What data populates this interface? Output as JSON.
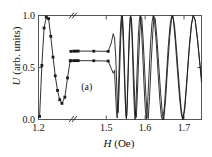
{
  "figure": {
    "panel_label": "(a)",
    "background": "#ffffff",
    "line_color": "#1a1a1a",
    "axis_color": "#555555"
  },
  "axes": {
    "x": {
      "label_var": "H",
      "label_unit": "(Oe)",
      "ticks": [
        "1.2",
        "1.5",
        "1.6",
        "1.7"
      ],
      "tick_values": [
        1.2,
        1.5,
        1.6,
        1.7
      ],
      "broken": true,
      "break_marker": "//",
      "range": [
        1.2,
        1.745
      ]
    },
    "y": {
      "label_var": "U",
      "label_unit": "(arb. units)",
      "ticks": [
        "0.0",
        "0.5",
        "1.0"
      ],
      "tick_values": [
        0.0,
        0.5,
        1.0
      ],
      "range": [
        0.0,
        1.0
      ]
    }
  },
  "chart_data": {
    "type": "line",
    "title": "",
    "xlabel": "H (Oe)",
    "ylabel": "U (arb. units)",
    "xlim": [
      1.2,
      1.745
    ],
    "ylim": [
      0.0,
      1.0
    ],
    "grid": false,
    "legend": null,
    "axis_break": {
      "after": 1.215,
      "resumes": 1.43,
      "marker": "//"
    },
    "annotations": [
      {
        "text": "(a)",
        "x": 1.45,
        "y": 0.28
      }
    ],
    "series": [
      {
        "name": "spike-branch",
        "marker": "square",
        "points": [
          [
            1.2005,
            0.03
          ],
          [
            1.2015,
            0.52
          ],
          [
            1.2025,
            0.88
          ],
          [
            1.2035,
            0.985
          ],
          [
            1.2045,
            0.97
          ],
          [
            1.2055,
            0.8
          ],
          [
            1.2065,
            0.6
          ],
          [
            1.2075,
            0.42
          ],
          [
            1.2085,
            0.28
          ],
          [
            1.2095,
            0.19
          ],
          [
            1.2105,
            0.155
          ],
          [
            1.2118,
            0.215
          ],
          [
            1.213,
            0.4
          ],
          [
            1.2142,
            0.565
          ]
        ]
      },
      {
        "name": "upper-plateau",
        "marker": "square",
        "marker_x": [
          1.2145,
          1.268,
          1.335,
          1.405,
          1.468,
          1.505
        ],
        "points": [
          [
            1.2145,
            0.655
          ],
          [
            1.268,
            0.657
          ],
          [
            1.335,
            0.657
          ],
          [
            1.405,
            0.658
          ],
          [
            1.468,
            0.657
          ],
          [
            1.505,
            0.655
          ],
          [
            1.513,
            0.735
          ],
          [
            1.518,
            0.825
          ],
          [
            1.5215,
            0.78
          ]
        ]
      },
      {
        "name": "lower-plateau",
        "marker": "square",
        "marker_x": [
          1.2145,
          1.268,
          1.335,
          1.405,
          1.468,
          1.505
        ],
        "points": [
          [
            1.2145,
            0.565
          ],
          [
            1.268,
            0.566
          ],
          [
            1.335,
            0.566
          ],
          [
            1.405,
            0.566
          ],
          [
            1.468,
            0.565
          ],
          [
            1.505,
            0.562
          ],
          [
            1.512,
            0.5
          ],
          [
            1.518,
            0.445
          ],
          [
            1.5215,
            0.47
          ]
        ]
      },
      {
        "name": "chirped-oscillation",
        "marker": "none",
        "comment": "interference fringes, period grows with H",
        "points": [
          [
            1.5215,
            0.78
          ],
          [
            1.5245,
            0.6
          ],
          [
            1.527,
            0.33
          ],
          [
            1.529,
            0.12
          ],
          [
            1.5305,
            0.065
          ],
          [
            1.5325,
            0.22
          ],
          [
            1.535,
            0.52
          ],
          [
            1.5375,
            0.8
          ],
          [
            1.54,
            0.97
          ],
          [
            1.5415,
            0.995
          ],
          [
            1.5435,
            0.9
          ],
          [
            1.546,
            0.62
          ],
          [
            1.5485,
            0.3
          ],
          [
            1.5505,
            0.06
          ],
          [
            1.552,
            0.005
          ],
          [
            1.554,
            0.17
          ],
          [
            1.5565,
            0.5
          ],
          [
            1.559,
            0.82
          ],
          [
            1.5615,
            0.98
          ],
          [
            1.563,
            1.0
          ],
          [
            1.565,
            0.93
          ],
          [
            1.5675,
            0.66
          ],
          [
            1.57,
            0.33
          ],
          [
            1.5725,
            0.08
          ],
          [
            1.5742,
            0.0
          ],
          [
            1.5765,
            0.14
          ],
          [
            1.5795,
            0.48
          ],
          [
            1.5825,
            0.8
          ],
          [
            1.5855,
            0.97
          ],
          [
            1.5875,
            1.0
          ],
          [
            1.59,
            0.92
          ],
          [
            1.5935,
            0.66
          ],
          [
            1.597,
            0.35
          ],
          [
            1.6005,
            0.1
          ],
          [
            1.603,
            0.005
          ],
          [
            1.606,
            0.12
          ],
          [
            1.61,
            0.43
          ],
          [
            1.614,
            0.74
          ],
          [
            1.618,
            0.94
          ],
          [
            1.621,
            1.0
          ],
          [
            1.6245,
            0.94
          ],
          [
            1.629,
            0.72
          ],
          [
            1.6335,
            0.44
          ],
          [
            1.638,
            0.18
          ],
          [
            1.642,
            0.02
          ],
          [
            1.645,
            0.0
          ],
          [
            1.6495,
            0.12
          ],
          [
            1.6545,
            0.4
          ],
          [
            1.6595,
            0.7
          ],
          [
            1.6645,
            0.92
          ],
          [
            1.6685,
            1.0
          ],
          [
            1.6725,
            0.96
          ],
          [
            1.6775,
            0.76
          ],
          [
            1.683,
            0.48
          ],
          [
            1.6885,
            0.21
          ],
          [
            1.6935,
            0.04
          ],
          [
            1.697,
            0.0
          ],
          [
            1.702,
            0.13
          ],
          [
            1.708,
            0.42
          ],
          [
            1.714,
            0.72
          ],
          [
            1.7195,
            0.93
          ],
          [
            1.724,
            1.0
          ],
          [
            1.729,
            0.95
          ],
          [
            1.735,
            0.76
          ],
          [
            1.741,
            0.52
          ],
          [
            1.745,
            0.36
          ]
        ]
      },
      {
        "name": "chirped-oscillation-second",
        "marker": "none",
        "comment": "second interleaved fringe branch (phase-shifted)",
        "points": [
          [
            1.5215,
            0.47
          ],
          [
            1.524,
            0.26
          ],
          [
            1.5262,
            0.09
          ],
          [
            1.528,
            0.015
          ],
          [
            1.53,
            0.13
          ],
          [
            1.5325,
            0.42
          ],
          [
            1.535,
            0.72
          ],
          [
            1.5375,
            0.93
          ],
          [
            1.5392,
            1.0
          ],
          [
            1.5412,
            0.96
          ],
          [
            1.5438,
            0.74
          ],
          [
            1.5465,
            0.44
          ],
          [
            1.549,
            0.17
          ],
          [
            1.5512,
            0.02
          ],
          [
            1.553,
            0.04
          ],
          [
            1.5552,
            0.28
          ],
          [
            1.5578,
            0.6
          ],
          [
            1.5605,
            0.87
          ],
          [
            1.5625,
            0.99
          ],
          [
            1.5645,
            0.98
          ],
          [
            1.5672,
            0.8
          ],
          [
            1.57,
            0.52
          ],
          [
            1.573,
            0.22
          ],
          [
            1.5755,
            0.03
          ],
          [
            1.5775,
            0.02
          ],
          [
            1.58,
            0.24
          ],
          [
            1.5832,
            0.57
          ],
          [
            1.5865,
            0.85
          ],
          [
            1.5892,
            0.99
          ],
          [
            1.5915,
            0.97
          ],
          [
            1.5948,
            0.78
          ],
          [
            1.5985,
            0.5
          ],
          [
            1.6022,
            0.22
          ],
          [
            1.6055,
            0.03
          ],
          [
            1.608,
            0.01
          ],
          [
            1.6115,
            0.22
          ],
          [
            1.6155,
            0.54
          ],
          [
            1.6195,
            0.82
          ],
          [
            1.6228,
            0.99
          ],
          [
            1.626,
            0.97
          ],
          [
            1.63,
            0.8
          ],
          [
            1.6348,
            0.54
          ],
          [
            1.6398,
            0.26
          ],
          [
            1.6445,
            0.05
          ],
          [
            1.648,
            0.0
          ],
          [
            1.6525,
            0.18
          ],
          [
            1.6578,
            0.5
          ],
          [
            1.6632,
            0.79
          ],
          [
            1.668,
            0.97
          ],
          [
            1.6715,
            1.0
          ],
          [
            1.676,
            0.89
          ],
          [
            1.6815,
            0.64
          ],
          [
            1.6875,
            0.34
          ],
          [
            1.693,
            0.09
          ],
          [
            1.697,
            0.0
          ],
          [
            1.7015,
            0.08
          ],
          [
            1.707,
            0.34
          ],
          [
            1.713,
            0.66
          ],
          [
            1.719,
            0.9
          ],
          [
            1.7235,
            1.0
          ],
          [
            1.7285,
            0.96
          ],
          [
            1.7345,
            0.78
          ],
          [
            1.7405,
            0.55
          ],
          [
            1.745,
            0.4
          ]
        ]
      }
    ]
  }
}
